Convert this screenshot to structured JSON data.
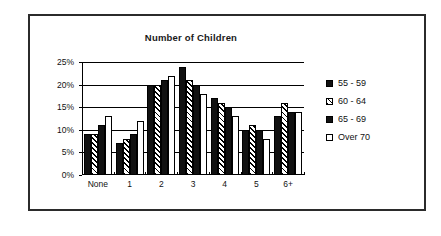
{
  "chart_data": {
    "type": "bar",
    "title": "Number of Children",
    "xlabel": "",
    "ylabel": "",
    "ylim": [
      0,
      25
    ],
    "ytick_labels": [
      "0%",
      "5%",
      "10%",
      "15%",
      "20%",
      "25%"
    ],
    "ytick_values": [
      0,
      5,
      10,
      15,
      20,
      25
    ],
    "grid": true,
    "legend_position": "right",
    "categories": [
      "None",
      "1",
      "2",
      "3",
      "4",
      "5",
      "6+"
    ],
    "series": [
      {
        "name": "55 - 59",
        "pattern": "solid-black",
        "values": [
          9,
          7,
          20,
          24,
          17,
          10,
          13
        ]
      },
      {
        "name": "60 - 64",
        "pattern": "diagonal-hatch",
        "values": [
          9,
          8,
          20,
          21,
          16,
          11,
          16
        ]
      },
      {
        "name": "65 - 69",
        "pattern": "solid-black",
        "values": [
          11,
          9,
          21,
          20,
          15,
          10,
          14
        ]
      },
      {
        "name": "Over 70",
        "pattern": "white-outline",
        "values": [
          13,
          12,
          22,
          18,
          13,
          8,
          14
        ]
      }
    ]
  },
  "colors": {
    "series_fill": "#111111",
    "outline": "#000000",
    "frame": "#2b2b2b",
    "background": "#ffffff"
  }
}
